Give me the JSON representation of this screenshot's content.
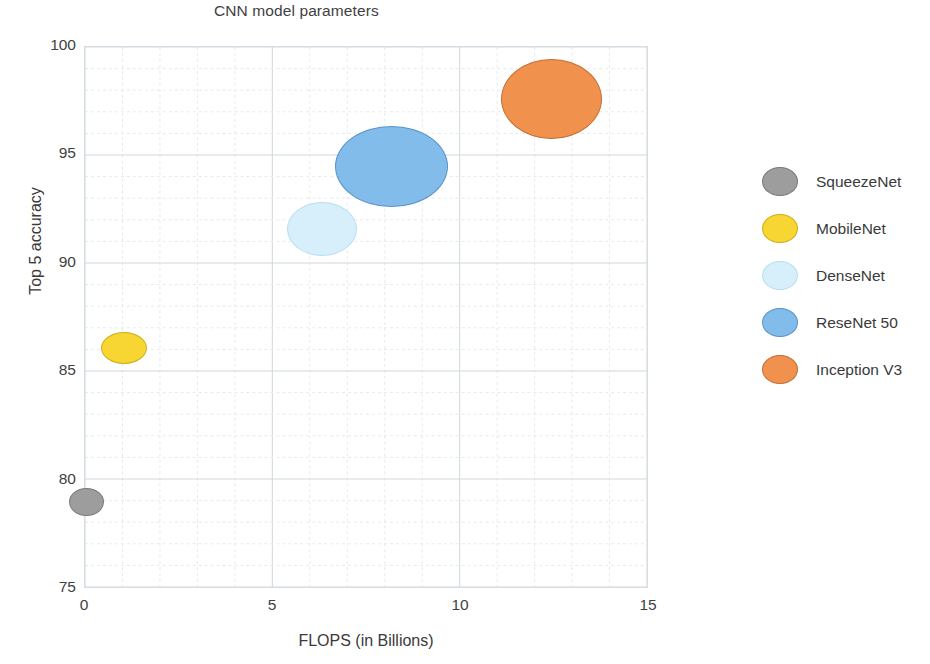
{
  "chart_data": {
    "type": "scatter",
    "title": "CNN model parameters",
    "xlabel": "FLOPS (in Billions)",
    "ylabel": "Top 5 accuracy",
    "xlim": [
      0,
      15
    ],
    "ylim": [
      75,
      100
    ],
    "xticks": [
      "0",
      "5",
      "10",
      "15"
    ],
    "xtick_values": [
      0,
      5,
      10,
      15
    ],
    "yticks": [
      "75",
      "80",
      "85",
      "90",
      "95",
      "100"
    ],
    "ytick_values": [
      75,
      80,
      85,
      90,
      95,
      100
    ],
    "grid": true,
    "grid_minor": true,
    "grid_color": "#dfe5ea",
    "legend_position": "right",
    "bubble_size_meaning": "Number of model parameters",
    "points": [
      {
        "name": "SqueezeNet",
        "x": 0.05,
        "y": 79.0,
        "size_px_w": 35,
        "size_px_h": 28,
        "color": "#9d9d9d",
        "edge": "#7a7a7a"
      },
      {
        "name": "MobileNet",
        "x": 1.05,
        "y": 86.1,
        "size_px_w": 46,
        "size_px_h": 32,
        "color": "#f7d634",
        "edge": "#cfae17"
      },
      {
        "name": "DenseNet",
        "x": 6.3,
        "y": 91.6,
        "size_px_w": 70,
        "size_px_h": 54,
        "color": "#d6effb",
        "edge": "#b6dff2"
      },
      {
        "name": "ReseNet 50",
        "x": 8.15,
        "y": 94.5,
        "size_px_w": 113,
        "size_px_h": 81,
        "color": "#81bcea",
        "edge": "#5a93c9"
      },
      {
        "name": "Inception V3",
        "x": 12.4,
        "y": 97.6,
        "size_px_w": 101,
        "size_px_h": 80,
        "color": "#f0914e",
        "edge": "#c46f32"
      }
    ]
  },
  "legend": {
    "items": [
      {
        "label": "SqueezeNet",
        "color": "#9d9d9d",
        "edge": "#7a7a7a"
      },
      {
        "label": "MobileNet",
        "color": "#f7d634",
        "edge": "#cfae17"
      },
      {
        "label": "DenseNet",
        "color": "#d6effb",
        "edge": "#b6dff2"
      },
      {
        "label": "ReseNet 50",
        "color": "#81bcea",
        "edge": "#5a93c9"
      },
      {
        "label": "Inception V3",
        "color": "#f0914e",
        "edge": "#c46f32"
      }
    ]
  }
}
